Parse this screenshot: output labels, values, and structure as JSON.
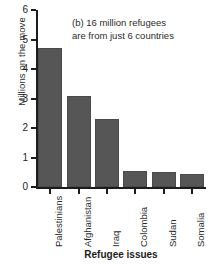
{
  "chart_data": {
    "type": "bar",
    "title": "",
    "annotation_lines": [
      "(b) 16 million refugees",
      "are from just 6 countries"
    ],
    "categories": [
      "Palestinians",
      "Afghanistan",
      "Iraq",
      "Colombia",
      "Sudan",
      "Somalia"
    ],
    "values": [
      4.7,
      3.1,
      2.3,
      0.54,
      0.5,
      0.44
    ],
    "xlabel": "Refugee issues",
    "ylabel": "Millions on the move",
    "ylim": [
      0,
      6
    ],
    "yticks": [
      0,
      1,
      2,
      3,
      4,
      5,
      6
    ],
    "ytick_labels": [
      "0",
      "1",
      "2",
      "3",
      "4",
      "5",
      "6"
    ],
    "grid": false,
    "legend": false,
    "bar_color": "#565656",
    "axis_color": "#1c1c1c"
  }
}
